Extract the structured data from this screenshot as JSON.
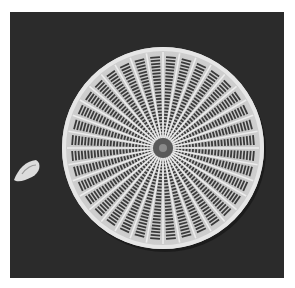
{
  "image": {
    "subject": "diatom-frustule-sem",
    "background_color": "#2b2b2b",
    "page_color": "#ffffff",
    "valve": {
      "center": [
        163,
        148
      ],
      "radius": 101,
      "rim_color": "#e6e6e6",
      "rib_count": 36,
      "areola_color": "#3a3a3a"
    },
    "particle": {
      "center": [
        28,
        171
      ],
      "color": "#dcdcdc"
    }
  }
}
